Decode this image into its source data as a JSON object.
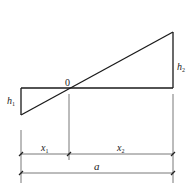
{
  "diagram": {
    "type": "linear-distribution-with-dimensions",
    "labels": {
      "zero": "0",
      "h1_main": "h",
      "h1_sub": "1",
      "h2_main": "h",
      "h2_sub": "2",
      "x1_main": "x",
      "x1_sub": "1",
      "x2_main": "x",
      "x2_sub": "2",
      "a": "a"
    },
    "colors": {
      "shape_stroke": "#1a1a1a",
      "dimension_stroke": "#555555",
      "text": "#222222"
    }
  }
}
